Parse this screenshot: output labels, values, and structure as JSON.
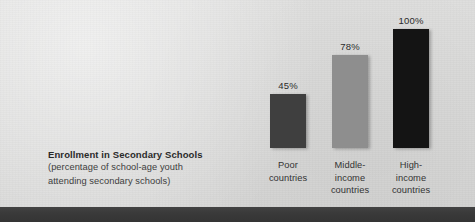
{
  "figure": {
    "background_color": "#dbdbda",
    "footer_color": "#3a3a3a"
  },
  "caption": {
    "title": "Enrollment in Secondary Schools",
    "subtitle_line1": "(percentage of school-age youth",
    "subtitle_line2": "attending secondary schools)"
  },
  "chart_data": {
    "type": "bar",
    "title": "Enrollment in Secondary Schools",
    "subtitle": "(percentage of school-age youth attending secondary schools)",
    "categories": [
      "Poor countries",
      "Middle-income countries",
      "High-income countries"
    ],
    "values": [
      45,
      78,
      100
    ],
    "value_labels": [
      "45%",
      "78%",
      "100%"
    ],
    "bar_colors": [
      "#3f3f3f",
      "#8e8e8e",
      "#141414"
    ],
    "xlabel": "",
    "ylabel": "",
    "ylim": [
      0,
      100
    ],
    "grid": false,
    "legend": "none",
    "series": [
      {
        "name": "Enrollment",
        "values": [
          45,
          78,
          100
        ]
      }
    ],
    "bars": [
      {
        "label_line1": "Poor",
        "label_line2": "countries",
        "label_line3": "",
        "value": 45,
        "value_label": "45%",
        "color": "#3f3f3f"
      },
      {
        "label_line1": "Middle-",
        "label_line2": "income",
        "label_line3": "countries",
        "value": 78,
        "value_label": "78%",
        "color": "#8e8e8e"
      },
      {
        "label_line1": "High-",
        "label_line2": "income",
        "label_line3": "countries",
        "value": 100,
        "value_label": "100%",
        "color": "#141414"
      }
    ]
  }
}
